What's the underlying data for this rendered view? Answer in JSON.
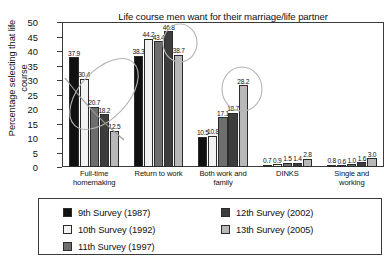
{
  "chart_data": {
    "type": "bar",
    "title": "Life course men want for their marriage/life partner",
    "xlabel": "",
    "ylabel": "Percentage selecting that life course",
    "ylabel_line1": "Percentage selecting that life",
    "ylabel_line2": "course",
    "ylim": [
      0,
      50
    ],
    "ytick_step": 5,
    "yticks": [
      "50",
      "45",
      "40",
      "35",
      "30",
      "25",
      "20",
      "15",
      "10",
      "5",
      "0"
    ],
    "grid": false,
    "legend_position": "below-plot",
    "categories": [
      "Full-time homemaking",
      "Return to work",
      "Both work and family",
      "DINKS",
      "Single and working"
    ],
    "category_labels": [
      {
        "line1": "Full-time",
        "line2": "homemaking"
      },
      {
        "line1": "Return to work",
        "line2": ""
      },
      {
        "line1": "Both work and",
        "line2": "family"
      },
      {
        "line1": "DINKS",
        "line2": ""
      },
      {
        "line1": "Single and",
        "line2": "working"
      }
    ],
    "series": [
      {
        "name": "9th Survey (1987)",
        "color": "#111111",
        "values": [
          37.9,
          38.3,
          10.5,
          0.7,
          0.8
        ]
      },
      {
        "name": "10th Survey (1992)",
        "color": "#f2f2f2",
        "values": [
          30.4,
          44.2,
          10.8,
          0.9,
          0.6
        ]
      },
      {
        "name": "11th Survey (1997)",
        "color": "#6e6e6e",
        "values": [
          20.7,
          43.4,
          17.1,
          1.5,
          1.0
        ]
      },
      {
        "name": "12th Survey (2002)",
        "color": "#3d3d3d",
        "values": [
          18.2,
          46.8,
          18.7,
          1.4,
          1.6
        ]
      },
      {
        "name": "13th Survey (2005)",
        "color": "#b8b8b8",
        "values": [
          12.5,
          38.7,
          28.2,
          2.8,
          3.0
        ]
      }
    ],
    "value_labels": [
      [
        "37.9",
        "30.4",
        "20.7",
        "18.2",
        "12.5"
      ],
      [
        "38.3",
        "44.2",
        "43.4",
        "46.8",
        "38.7"
      ],
      [
        "10.5",
        "10.8",
        "17.1",
        "18.7",
        "28.2"
      ],
      [
        "0.7",
        "0.9",
        "1.5",
        "1.4",
        "2.8"
      ],
      [
        "0.8",
        "0.6",
        "1.0",
        "1.6",
        "3.0"
      ]
    ],
    "annotations": [
      {
        "name": "declining-trend-ellipse",
        "group": "Full-time homemaking",
        "shape": "ellipse"
      },
      {
        "name": "declining-trend-line",
        "group": "Full-time homemaking",
        "shape": "line"
      },
      {
        "name": "peak-highlight-circle",
        "group": "Return to work",
        "shape": "circle",
        "target_value": "46.8"
      },
      {
        "name": "rising-highlight-circle",
        "group": "Both work and family",
        "shape": "circle",
        "target_value": "28.2"
      }
    ]
  },
  "legend": {
    "items": [
      {
        "label": "9th Survey (1987)",
        "color": "#111111"
      },
      {
        "label": "10th Survey (1992)",
        "color": "#f2f2f2"
      },
      {
        "label": "11th Survey (1997)",
        "color": "#6e6e6e"
      },
      {
        "label": "12th Survey (2002)",
        "color": "#3d3d3d"
      },
      {
        "label": "13th Survey (2005)",
        "color": "#b8b8b8"
      }
    ]
  }
}
